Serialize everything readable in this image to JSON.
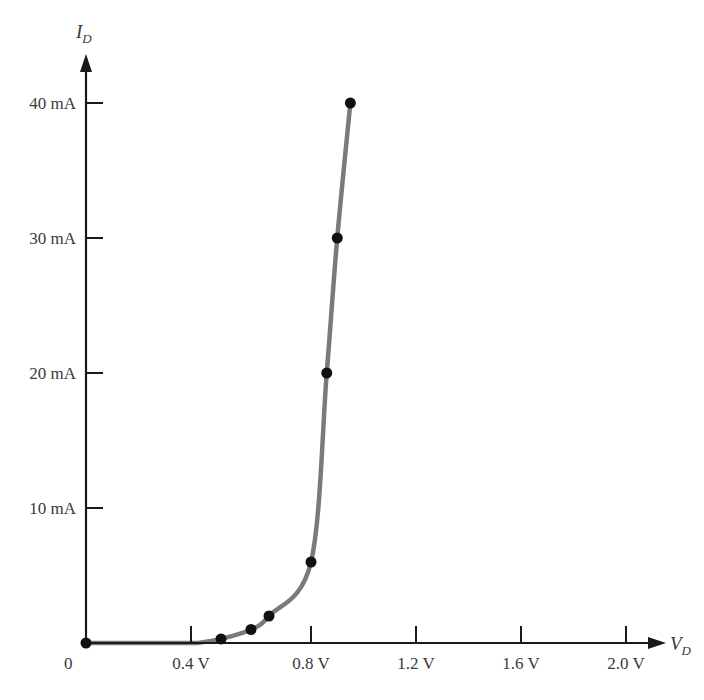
{
  "chart_data": {
    "type": "line",
    "title": "",
    "xlabel": "V_D",
    "ylabel": "I_D",
    "xlabel_main": "V",
    "xlabel_sub": "D",
    "ylabel_main": "I",
    "ylabel_sub": "D",
    "origin_label": "0",
    "x_ticks": [
      {
        "value": 0.4,
        "label": "0.4 V"
      },
      {
        "value": 0.8,
        "label": "0.8 V"
      },
      {
        "value": 1.2,
        "label": "1.2 V"
      },
      {
        "value": 1.6,
        "label": "1.6 V"
      },
      {
        "value": 2.0,
        "label": "2.0 V"
      }
    ],
    "y_ticks": [
      {
        "value": 10,
        "label": "10 mA"
      },
      {
        "value": 20,
        "label": "20 mA"
      },
      {
        "value": 30,
        "label": "30 mA"
      },
      {
        "value": 40,
        "label": "40 mA"
      }
    ],
    "xlim": [
      0,
      2.1
    ],
    "ylim": [
      0,
      42
    ],
    "x_unit": "V",
    "y_unit": "mA",
    "grid": false,
    "legend": null,
    "series": [
      {
        "name": "Diode forward characteristic",
        "marker": "circle",
        "line_color": "#7a7a7a",
        "marker_color": "#111111",
        "x": [
          0.0,
          0.5,
          0.6,
          0.66,
          0.8,
          0.86,
          0.9,
          0.95
        ],
        "y": [
          0.0,
          0.3,
          1.0,
          2.0,
          6.0,
          20.0,
          30.0,
          40.0
        ]
      }
    ]
  },
  "colors": {
    "axis": "#1a1a1a",
    "curve": "#7a7a7a",
    "marker": "#111111",
    "text": "#3a3a3a",
    "background": "#ffffff"
  }
}
